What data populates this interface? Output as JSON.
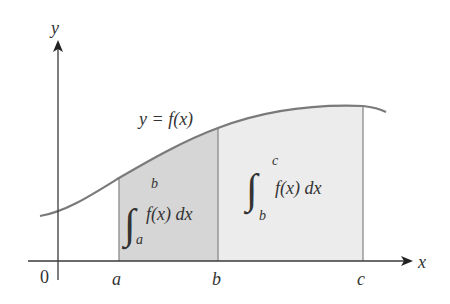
{
  "axes": {
    "x_label": "x",
    "y_label": "y",
    "origin_label": "0"
  },
  "curve": {
    "label": "y = f(x)"
  },
  "points": {
    "a": "a",
    "b": "b",
    "c": "c"
  },
  "regions": [
    {
      "name": "integral-a-to-b",
      "integrand": "f(x) dx",
      "lower": "a",
      "upper": "b",
      "fill": "#d6d6d6"
    },
    {
      "name": "integral-b-to-c",
      "integrand": "f(x) dx",
      "lower": "b",
      "upper": "c",
      "fill": "#ececec"
    }
  ],
  "colors": {
    "axis": "#3a3a3a",
    "curve": "#7a7a7a",
    "divider": "#8a8a8a"
  }
}
